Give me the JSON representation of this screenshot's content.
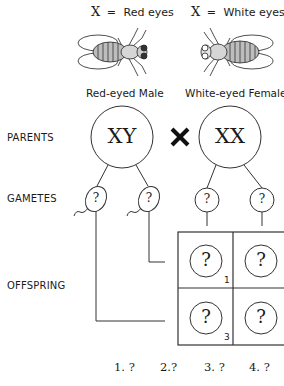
{
  "legend": {
    "left": {
      "symbol": "X",
      "equals": "=",
      "text": "Red eyes"
    },
    "right": {
      "symbol": "X",
      "equals": "=",
      "text": "White eyes"
    }
  },
  "flies": {
    "left": {
      "label": "Red-eyed Male",
      "icon": "fruit-fly-icon"
    },
    "right": {
      "label": "White-eyed Female",
      "icon": "fruit-fly-icon"
    }
  },
  "rows": {
    "parents": "PARENTS",
    "gametes": "GAMETES",
    "offspring": "OFFSPRING"
  },
  "parents": {
    "male": "XY",
    "cross": "×",
    "female": "XX"
  },
  "gametes": {
    "sperm": [
      "?",
      "?"
    ],
    "eggs": [
      "?",
      "?"
    ]
  },
  "punnett": {
    "cells": [
      {
        "value": "?",
        "index": "1"
      },
      {
        "value": "?",
        "index": ""
      },
      {
        "value": "?",
        "index": "3"
      },
      {
        "value": "?",
        "index": ""
      }
    ]
  },
  "answers": [
    {
      "label": "1.",
      "value": "?"
    },
    {
      "label": "2.",
      "value": "?"
    },
    {
      "label": "3.",
      "value": "?"
    },
    {
      "label": "4.",
      "value": "?"
    }
  ],
  "colors": {
    "line": "#333333",
    "fly_body": "#cfcfcf",
    "background": "#ffffff"
  }
}
